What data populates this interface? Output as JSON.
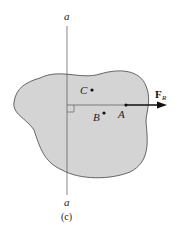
{
  "diagram": {
    "axis_label_top": "a",
    "axis_label_bottom": "a",
    "points": {
      "A": "A",
      "B": "B",
      "C": "C"
    },
    "force_label": "F",
    "force_subscript": "R",
    "caption": "(c)",
    "colors": {
      "body_fill": "#d4d4d4",
      "body_stroke": "#444444",
      "line": "#333333",
      "arrow": "#111111"
    }
  }
}
